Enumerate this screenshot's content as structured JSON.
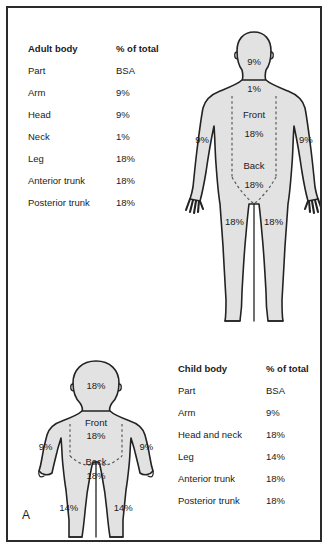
{
  "panel": {
    "letter": "A"
  },
  "adult_table": {
    "header": {
      "part": "Adult body",
      "value": "% of total"
    },
    "subheader": {
      "part": "Part",
      "value": "BSA"
    },
    "rows": [
      {
        "part": "Arm",
        "value": "9%"
      },
      {
        "part": "Head",
        "value": "9%"
      },
      {
        "part": "Neck",
        "value": "1%"
      },
      {
        "part": "Leg",
        "value": "18%"
      },
      {
        "part": "Anterior trunk",
        "value": "18%"
      },
      {
        "part": "Posterior trunk",
        "value": "18%"
      }
    ]
  },
  "child_table": {
    "header": {
      "part": "Child body",
      "value": "% of total"
    },
    "subheader": {
      "part": "Part",
      "value": "BSA"
    },
    "rows": [
      {
        "part": "Arm",
        "value": "9%"
      },
      {
        "part": "Head and neck",
        "value": "18%"
      },
      {
        "part": "Leg",
        "value": "14%"
      },
      {
        "part": "Anterior trunk",
        "value": "18%"
      },
      {
        "part": "Posterior trunk",
        "value": "18%"
      }
    ]
  },
  "adult_figure": {
    "head": "9%",
    "neck": "1%",
    "front_label": "Front",
    "front_value": "18%",
    "back_label": "Back",
    "back_value": "18%",
    "arm_left": "9%",
    "arm_right": "9%",
    "leg_left": "18%",
    "leg_right": "18%"
  },
  "child_figure": {
    "head": "18%",
    "front_label": "Front",
    "front_value": "18%",
    "back_label": "Back",
    "back_value": "18%",
    "arm_left": "9%",
    "arm_right": "9%",
    "leg_left": "14%",
    "leg_right": "14%"
  },
  "colors": {
    "body_fill": "#e2e2e2",
    "outline": "#232323",
    "frame": "#2b2b2b",
    "dashed_divider": "#5a5a5a",
    "text": "#1b1b1b"
  }
}
